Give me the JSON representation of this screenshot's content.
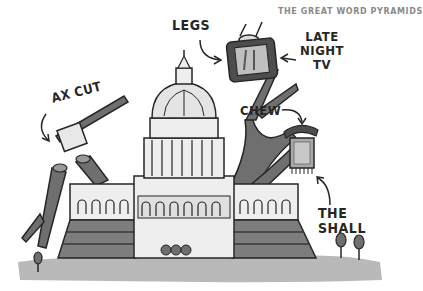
{
  "credit": "THE GREAT WORD PYRAMIDS",
  "labels": {
    "legs": "LEGS",
    "late_night_tv": [
      "LATE",
      "NIGHT",
      "TV"
    ],
    "ax_cut": "AX CUT",
    "chew": "CHEW",
    "the_shall": [
      "THE",
      "SHALL"
    ]
  },
  "colors": {
    "ink": "#262626",
    "grass": "#b8b8b8",
    "branch": "#6f6f6f",
    "stone": "#e6e6e6",
    "steps": "#7d7d7d"
  }
}
